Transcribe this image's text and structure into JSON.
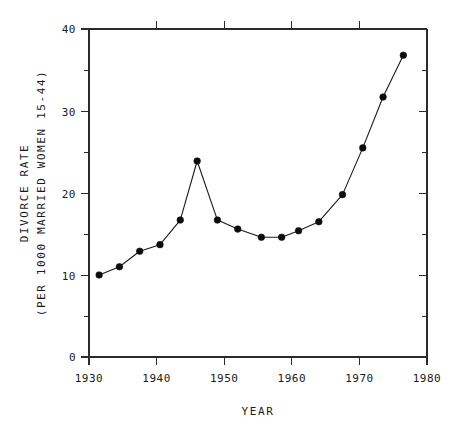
{
  "chart_data": {
    "type": "line",
    "title": "",
    "subtitle": "",
    "xlabel": "YEAR",
    "ylabel_line1": "DIVORCE RATE",
    "ylabel_line2": "(PER 1000 MARRIED WOMEN 15-44)",
    "xlim": [
      1930,
      1980
    ],
    "ylim": [
      0,
      40
    ],
    "x_major_ticks": [
      1930,
      1940,
      1950,
      1960,
      1970,
      1980
    ],
    "x_tick_labels": [
      "1930",
      "1940",
      "1950",
      "1960",
      "1970",
      "1980"
    ],
    "y_major_ticks": [
      0,
      10,
      20,
      30,
      40
    ],
    "y_tick_labels": [
      "0",
      "10",
      "20",
      "30",
      "40"
    ],
    "y_minor_ticks": [
      5,
      15,
      25,
      35
    ],
    "grid": false,
    "legend": false,
    "legend_position": "none",
    "marker": "filled-circle",
    "series": [
      {
        "name": "Divorce rate",
        "x": [
          1931.5,
          1934.5,
          1937.5,
          1940.5,
          1943.5,
          1946.0,
          1949.0,
          1952.0,
          1955.5,
          1958.5,
          1961.0,
          1964.0,
          1967.5,
          1970.5,
          1973.5,
          1976.5
        ],
        "values": [
          10.0,
          11.0,
          12.9,
          13.7,
          16.7,
          23.9,
          16.7,
          15.6,
          14.6,
          14.6,
          15.4,
          16.5,
          19.8,
          25.5,
          31.7,
          36.8
        ]
      }
    ]
  },
  "figure": {
    "background_color": "#ffffff",
    "line_color": "#1a1a1a",
    "marker_color": "#0d0d0d",
    "axis_color": "#2b2b2b"
  }
}
